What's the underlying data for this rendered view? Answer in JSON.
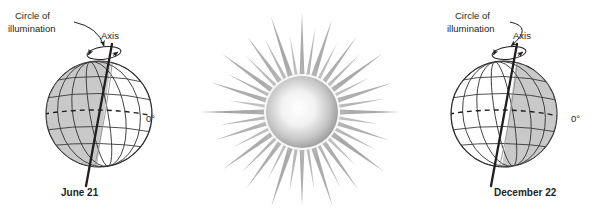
{
  "figure": {
    "background_color": "#ffffff",
    "ink_color": "#231f20",
    "shade_color": "#c9c9c9",
    "grid_color": "#3a3a3a"
  },
  "panels": [
    {
      "id": "june",
      "caption": "June 21",
      "labels": {
        "circle_of_illumination_line1": "Circle of",
        "circle_of_illumination_line2": "illumination",
        "axis": "Axis",
        "equator": "0°"
      },
      "shaded_side": "left",
      "axis_tilt_degrees": 23.5,
      "globe": {
        "cx": 99,
        "cy": 114,
        "r": 53
      }
    },
    {
      "id": "december",
      "caption": "December 22",
      "labels": {
        "circle_of_illumination_line1": "Circle of",
        "circle_of_illumination_line2": "illumination",
        "axis": "Axis",
        "equator": "0°"
      },
      "shaded_side": "right",
      "axis_tilt_degrees": 23.5,
      "globe": {
        "cx": 504,
        "cy": 114,
        "r": 53
      }
    }
  ],
  "sun": {
    "name": "sun",
    "cx": 302,
    "cy": 112,
    "core_radius": 36,
    "ray_count": 40,
    "ray_max_length": 62,
    "core_color_center": "#ffffff",
    "core_color_edge": "#8e8e8e",
    "ray_color": "#9a9a9a"
  },
  "icons": {
    "rotation_arrow": "rotation-arrow-icon",
    "pointer_curve": "leader-line-icon"
  }
}
